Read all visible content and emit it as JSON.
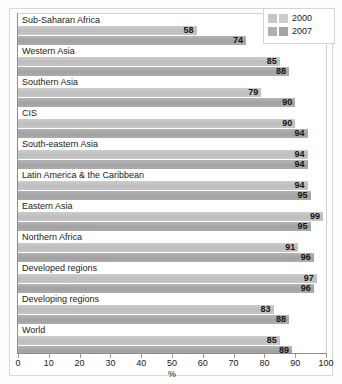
{
  "chart_data": {
    "type": "bar",
    "orientation": "horizontal",
    "title": "",
    "xlabel": "%",
    "ylabel": "",
    "xlim": [
      0,
      100
    ],
    "xticks": [
      0,
      10,
      20,
      30,
      40,
      50,
      60,
      70,
      80,
      90,
      100
    ],
    "grid": false,
    "legend_position": "top-right",
    "categories": [
      "Sub-Saharan Africa",
      "Western Asia",
      "Southern Asia",
      "CIS",
      "South-eastern Asia",
      "Latin America & the Caribbean",
      "Eastern Asia",
      "Northern Africa",
      "Developed regions",
      "Developing regions",
      "World"
    ],
    "series": [
      {
        "name": "2000",
        "color": "#c3c3c3",
        "values": [
          58,
          85,
          79,
          90,
          94,
          94,
          99,
          91,
          97,
          83,
          85
        ]
      },
      {
        "name": "2007",
        "color": "#a9a9a9",
        "values": [
          74,
          88,
          90,
          94,
          94,
          95,
          95,
          96,
          96,
          88,
          89
        ]
      }
    ]
  },
  "legend": {
    "entries": [
      {
        "label": "2000"
      },
      {
        "label": "2007"
      }
    ]
  },
  "axis": {
    "tick_labels": [
      "0",
      "10",
      "20",
      "30",
      "40",
      "50",
      "60",
      "70",
      "80",
      "90",
      "100"
    ],
    "title": "%"
  }
}
